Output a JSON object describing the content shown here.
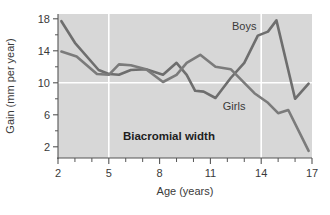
{
  "chart_data": {
    "type": "line",
    "title": "",
    "annotation_title": "Biacromial width",
    "xlabel": "Age (years)",
    "ylabel": "Gain (mm per year)",
    "xlim": [
      2,
      17
    ],
    "ylim": [
      0.6,
      18.6
    ],
    "xticks": [
      2,
      5,
      8,
      11,
      14,
      17
    ],
    "xtick_labels": [
      "2",
      "5",
      "8",
      "11",
      "14",
      "17"
    ],
    "xminor_ticks": [
      3,
      4,
      6,
      7,
      9,
      10,
      12,
      13,
      15,
      16
    ],
    "yticks": [
      2,
      6,
      10,
      14,
      18
    ],
    "ytick_labels": [
      "2",
      "6",
      "10",
      "14",
      "18"
    ],
    "yminor_ticks": [
      4,
      8,
      12,
      16
    ],
    "gridlines": {
      "vertical": [
        5,
        14
      ],
      "horizontal": [
        10
      ],
      "color": "#ffffff"
    },
    "plot_background": "#d7d7d7",
    "legend_position": "inline-annotations",
    "series": [
      {
        "name": "Boys",
        "color": "#6e6e6e",
        "label_x": 13.0,
        "label_y": 16.6,
        "x": [
          2.2,
          3.0,
          4.4,
          5.0,
          5.6,
          6.3,
          7.2,
          8.2,
          9.0,
          9.6,
          10.1,
          10.6,
          11.3,
          12.2,
          13.0,
          13.8,
          14.4,
          14.9,
          16.0,
          16.8
        ],
        "y": [
          17.7,
          15.0,
          11.6,
          11.1,
          11.0,
          11.6,
          11.7,
          11.0,
          12.5,
          11.0,
          9.0,
          8.9,
          8.1,
          10.6,
          12.5,
          15.9,
          16.4,
          17.8,
          8.0,
          9.9
        ]
      },
      {
        "name": "Girls",
        "color": "#7b7b7b",
        "label_x": 12.4,
        "label_y": 6.6,
        "x": [
          2.2,
          3.1,
          4.3,
          5.0,
          5.6,
          6.3,
          7.2,
          8.2,
          9.0,
          9.6,
          10.4,
          11.3,
          12.2,
          13.0,
          13.6,
          14.4,
          15.0,
          15.6,
          16.8
        ],
        "y": [
          13.9,
          13.3,
          11.1,
          11.0,
          12.3,
          12.2,
          11.7,
          10.1,
          11.0,
          12.5,
          13.5,
          12.0,
          11.7,
          10.0,
          8.7,
          7.5,
          6.2,
          6.6,
          1.5
        ]
      }
    ]
  },
  "figure": {
    "axis_color": "#555555",
    "text_color": "#3a3a3a"
  }
}
